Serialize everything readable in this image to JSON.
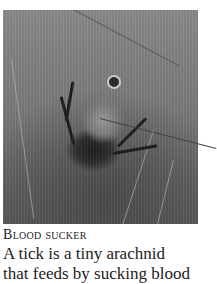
{
  "figure": {
    "image_alt": "Close-up photograph of an engorged tick clinging to grass stems",
    "caption_title": "Blood sucker",
    "caption_lines": [
      "A tick is a tiny arachnid",
      "that feeds by sucking blood"
    ]
  },
  "colors": {
    "background": "#ffffff",
    "text": "#222222",
    "pointer_line": "#444444"
  }
}
